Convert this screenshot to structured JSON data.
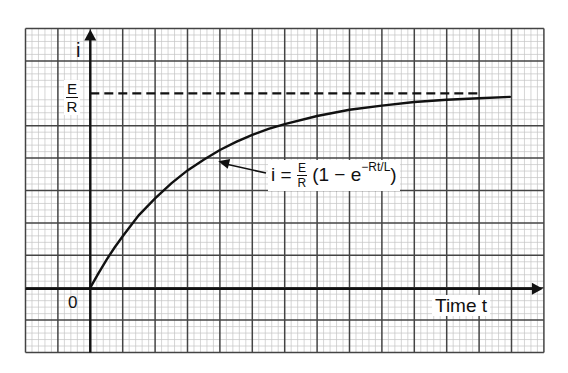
{
  "chart_data": {
    "type": "line",
    "title": "",
    "xlabel": "Time t",
    "ylabel": "i",
    "origin_label": "0",
    "asymptote_label": {
      "numerator": "E",
      "denominator": "R"
    },
    "asymptote_value": 6,
    "annotation": {
      "lhs": "i =",
      "frac_num": "E",
      "frac_den": "R",
      "rhs_open": "(1 − e",
      "exponent": "−Rt/L",
      "rhs_close": ")",
      "arrow_to": {
        "t": 3.95,
        "i": 3.9
      }
    },
    "grid": {
      "on": true,
      "major_cols": 16,
      "major_rows": 10,
      "minor_per_major": 5
    },
    "xlim": [
      -2,
      14
    ],
    "ylim": [
      -2,
      8
    ],
    "time_constant": 3.25,
    "series": [
      {
        "name": "i(t) = E/R (1 − e^(−Rt/L))",
        "x": [
          0,
          0.25,
          0.5,
          0.75,
          1,
          1.5,
          2,
          2.5,
          3,
          3.5,
          4,
          4.5,
          5,
          5.5,
          6,
          7,
          8,
          9,
          10,
          11,
          12,
          12.95
        ],
        "y": [
          0,
          0.44,
          0.86,
          1.24,
          1.59,
          2.24,
          2.76,
          3.22,
          3.62,
          3.95,
          4.25,
          4.5,
          4.72,
          4.9,
          5.05,
          5.3,
          5.49,
          5.62,
          5.73,
          5.8,
          5.85,
          5.89
        ]
      }
    ]
  },
  "colors": {
    "background": "#ffffff",
    "minor_grid": "#c4c4c4",
    "major_grid": "#444444",
    "curve": "#111111"
  }
}
